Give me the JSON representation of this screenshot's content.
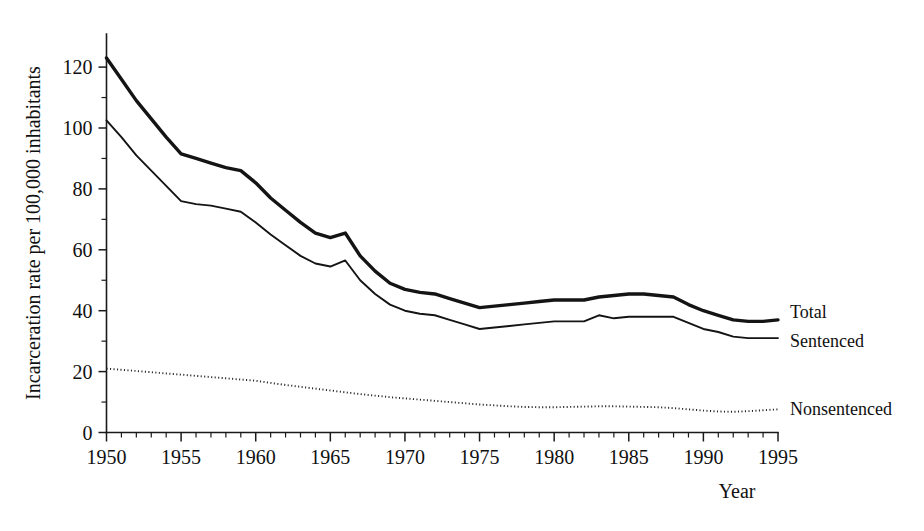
{
  "chart_data": {
    "type": "line",
    "title": "",
    "xlabel": "Year",
    "ylabel": "Incarceration rate per 100,000 inhabitants",
    "xlim": [
      1950,
      1995
    ],
    "ylim": [
      0,
      130
    ],
    "grid": false,
    "legend_position": "right-end-of-line",
    "x_ticks": [
      1950,
      1955,
      1960,
      1965,
      1970,
      1975,
      1980,
      1985,
      1990,
      1995
    ],
    "x_tick_labels": [
      "1950",
      "1955",
      "1960",
      "1965",
      "1970",
      "1975",
      "1980",
      "1985",
      "1990",
      "1995"
    ],
    "x_minor_tick_step": 1,
    "y_ticks": [
      0,
      20,
      40,
      60,
      80,
      100,
      120
    ],
    "y_tick_labels": [
      "0",
      "20",
      "40",
      "60",
      "80",
      "100",
      "120"
    ],
    "y_minor_ticks": [
      10,
      30,
      50,
      70,
      90,
      110
    ],
    "x": [
      1950,
      1951,
      1952,
      1953,
      1954,
      1955,
      1956,
      1957,
      1958,
      1959,
      1960,
      1961,
      1962,
      1963,
      1964,
      1965,
      1966,
      1967,
      1968,
      1969,
      1970,
      1971,
      1972,
      1973,
      1974,
      1975,
      1976,
      1977,
      1978,
      1979,
      1980,
      1981,
      1982,
      1983,
      1984,
      1985,
      1986,
      1987,
      1988,
      1989,
      1990,
      1991,
      1992,
      1993,
      1994,
      1995
    ],
    "series": [
      {
        "name": "Total",
        "style": "solid-thick",
        "color": "#141414",
        "values": [
          123,
          116,
          109,
          103,
          97,
          91.5,
          90,
          88.5,
          87,
          86,
          82,
          77,
          73,
          69,
          65.5,
          64,
          65.5,
          58,
          53,
          49,
          47,
          46,
          45.5,
          44,
          42.5,
          41,
          41.5,
          42,
          42.5,
          43,
          43.5,
          43.5,
          43.5,
          44.5,
          45,
          45.5,
          45.5,
          45,
          44.5,
          42,
          40,
          38.5,
          37,
          36.5,
          36.5,
          37
        ]
      },
      {
        "name": "Sentenced",
        "style": "solid-thin",
        "color": "#141414",
        "values": [
          102.5,
          97,
          91,
          86,
          81,
          76,
          75,
          74.5,
          73.5,
          72.5,
          69,
          65,
          61.5,
          58,
          55.5,
          54.5,
          56.5,
          50,
          45.5,
          42,
          40,
          39,
          38.5,
          37,
          35.5,
          34,
          34.5,
          35,
          35.5,
          36,
          36.5,
          36.5,
          36.5,
          38.5,
          37.5,
          38,
          38,
          38,
          38,
          36,
          34,
          33,
          31.5,
          31,
          31,
          31
        ]
      },
      {
        "name": "Nonsentenced",
        "style": "dotted",
        "color": "#262626",
        "values": [
          21,
          20.6,
          20.2,
          19.8,
          19.4,
          19,
          18.6,
          18.2,
          17.8,
          17.4,
          17,
          16.3,
          15.6,
          15,
          14.4,
          13.8,
          13.2,
          12.6,
          12.1,
          11.6,
          11.2,
          10.8,
          10.4,
          10,
          9.6,
          9.2,
          8.9,
          8.6,
          8.4,
          8.3,
          8.3,
          8.4,
          8.5,
          8.6,
          8.6,
          8.5,
          8.4,
          8.3,
          8,
          7.6,
          7.2,
          6.9,
          6.8,
          7,
          7.3,
          7.6
        ]
      }
    ]
  },
  "axes": {
    "y_title": "Incarceration rate per 100,000 inhabitants",
    "x_title": "Year"
  },
  "labels": {
    "total": "Total",
    "sentenced": "Sentenced",
    "nonsentenced": "Nonsentenced"
  }
}
